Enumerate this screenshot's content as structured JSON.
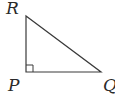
{
  "diagram": {
    "type": "right-triangle",
    "stroke_color": "#3a3a3a",
    "vertices": {
      "R": {
        "label": "R",
        "x": 26,
        "y": 16
      },
      "P": {
        "label": "P",
        "x": 26,
        "y": 72
      },
      "Q": {
        "label": "Q",
        "x": 101,
        "y": 72
      }
    },
    "right_angle_at": "P"
  }
}
